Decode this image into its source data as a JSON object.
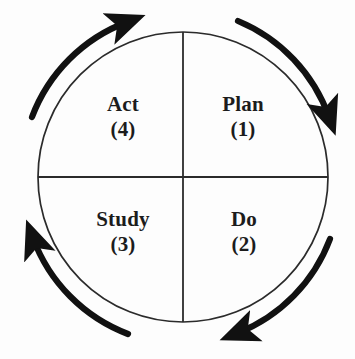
{
  "diagram": {
    "name": "PDSA cycle",
    "type": "cyclic-quadrant-diagram",
    "background_color": "#fdfdfd",
    "stroke_color": "#2b2b2b",
    "arrow_color": "#111111",
    "text_color": "#1c1c1c",
    "circle": {
      "center_x": 183,
      "center_y": 177,
      "radius": 145
    },
    "quadrants": [
      {
        "id": "plan",
        "label": "Plan",
        "number": "(1)",
        "position": "top-right"
      },
      {
        "id": "do",
        "label": "Do",
        "number": "(2)",
        "position": "bottom-right"
      },
      {
        "id": "study",
        "label": "Study",
        "number": "(3)",
        "position": "bottom-left"
      },
      {
        "id": "act",
        "label": "Act",
        "number": "(4)",
        "position": "top-left"
      }
    ],
    "arrows": [
      {
        "id": "arrow-top-right",
        "direction": "clockwise",
        "from_clock": "12",
        "to_clock": "2-3"
      },
      {
        "id": "arrow-bottom-right",
        "direction": "clockwise",
        "from_clock": "3-4",
        "to_clock": "6"
      },
      {
        "id": "arrow-bottom-left",
        "direction": "clockwise",
        "from_clock": "6-7",
        "to_clock": "8-9"
      },
      {
        "id": "arrow-top-left",
        "direction": "clockwise",
        "from_clock": "9-10",
        "to_clock": "12"
      }
    ],
    "dividers": {
      "vertical_x": 183,
      "horizontal_y": 177
    }
  }
}
